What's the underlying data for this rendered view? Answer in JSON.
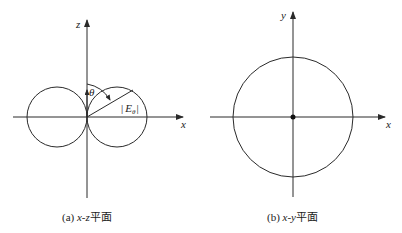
{
  "panels": [
    {
      "id": "a",
      "caption_prefix": "(a) ",
      "caption_axes": "x-z",
      "caption_suffix": "平面",
      "horizontal_axis_label": "x",
      "vertical_axis_label": "z",
      "angle_label": "θ",
      "field_label_prefix": "|",
      "field_label_main": "E",
      "field_label_sub": "θ",
      "field_label_suffix": "|",
      "pattern": "figure-eight (two tangent circles)"
    },
    {
      "id": "b",
      "caption_prefix": "(b) ",
      "caption_axes": "x-y",
      "caption_suffix": "平面",
      "horizontal_axis_label": "x",
      "vertical_axis_label": "y",
      "pattern": "circle (omnidirectional)"
    }
  ]
}
